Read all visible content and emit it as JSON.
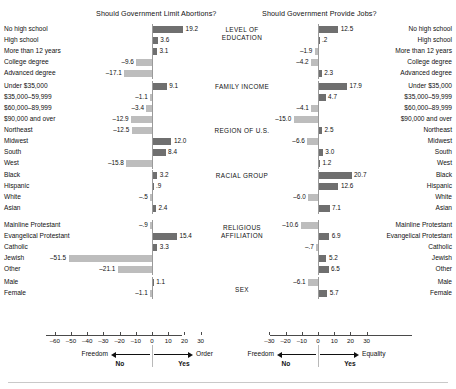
{
  "chart_data": {
    "type": "bar",
    "panels": [
      {
        "id": "abortions",
        "title": "Should Government Limit Abortions?",
        "xlabel": "",
        "ylabel": "",
        "xlim": [
          -65,
          33
        ],
        "ticks": [
          -60,
          -50,
          -40,
          -30,
          -20,
          -10,
          0,
          10,
          20,
          30
        ],
        "tick_labels": [
          "–60",
          "–50",
          "–40",
          "–30",
          "–20",
          "–10",
          "0",
          "10",
          "20",
          "30"
        ],
        "grid": false,
        "legend": {
          "left_word": "Freedom",
          "right_word": "Order",
          "left_answer": "No",
          "right_answer": "Yes"
        },
        "groups": [
          {
            "name": "LEVEL OF EDUCATION",
            "categories": [
              "No high school",
              "High school",
              "More than 12 years",
              "College degree",
              "Advanced degree"
            ],
            "values": [
              19.2,
              3.6,
              3.1,
              -9.6,
              -17.1
            ],
            "labels": [
              "19.2",
              "3.6",
              "3.1",
              "–9.6",
              "–17.1"
            ]
          },
          {
            "name": "FAMILY INCOME",
            "categories": [
              "Under $35,000",
              "$35,000–59,999",
              "$60,000–89,999",
              "$90,000 and over"
            ],
            "values": [
              9.1,
              -1.1,
              -3.4,
              -12.9
            ],
            "labels": [
              "9.1",
              "–1.1",
              "–3.4",
              "–12.9"
            ]
          },
          {
            "name": "REGION OF U.S.",
            "categories": [
              "Northeast",
              "Midwest",
              "South",
              "West"
            ],
            "values": [
              -12.5,
              12.0,
              8.4,
              -15.8
            ],
            "labels": [
              "–12.5",
              "12.0",
              "8.4",
              "–15.8"
            ]
          },
          {
            "name": "RACIAL GROUP",
            "categories": [
              "Black",
              "Hispanic",
              "White",
              "Asian"
            ],
            "values": [
              3.2,
              0.9,
              -0.5,
              2.4
            ],
            "labels": [
              "3.2",
              ".9",
              "–.5",
              "2.4"
            ]
          },
          {
            "name": "RELIGIOUS AFFILIATION",
            "categories": [
              "Mainline Protestant",
              "Evangelical Protestant",
              "Catholic",
              "Jewish",
              "Other"
            ],
            "values": [
              -0.9,
              15.4,
              3.3,
              -51.5,
              -21.1
            ],
            "labels": [
              "–.9",
              "15.4",
              "3.3",
              "–51.5",
              "–21.1"
            ]
          },
          {
            "name": "SEX",
            "categories": [
              "Male",
              "Female"
            ],
            "values": [
              1.1,
              -1.1
            ],
            "labels": [
              "1.1",
              "–1.1"
            ]
          }
        ]
      },
      {
        "id": "jobs",
        "title": "Should Government Provide Jobs?",
        "xlabel": "",
        "ylabel": "",
        "xlim": [
          -33,
          33
        ],
        "ticks": [
          -30,
          -20,
          -10,
          0,
          10,
          20,
          30
        ],
        "tick_labels": [
          "–30",
          "–20",
          "–10",
          "0",
          "10",
          "20",
          "30"
        ],
        "grid": false,
        "legend": {
          "left_word": "Freedom",
          "right_word": "Equality",
          "left_answer": "No",
          "right_answer": "Yes"
        },
        "groups": [
          {
            "name": "LEVEL OF EDUCATION",
            "categories": [
              "No high school",
              "High school",
              "More than 12 years",
              "College degree",
              "Advanced degree"
            ],
            "values": [
              12.5,
              0.2,
              -1.9,
              -4.2,
              2.3
            ],
            "labels": [
              "12.5",
              ".2",
              "–1.9",
              "–4.2",
              "2.3"
            ]
          },
          {
            "name": "FAMILY INCOME",
            "categories": [
              "Under $35,000",
              "$35,000–59,999",
              "$60,000–89,999",
              "$90,000 and over"
            ],
            "values": [
              17.9,
              4.7,
              -4.1,
              -15.0
            ],
            "labels": [
              "17.9",
              "4.7",
              "–4.1",
              "–15.0"
            ]
          },
          {
            "name": "REGION OF U.S.",
            "categories": [
              "Northeast",
              "Midwest",
              "South",
              "West"
            ],
            "values": [
              2.5,
              -6.6,
              3.0,
              1.2
            ],
            "labels": [
              "2.5",
              "–6.6",
              "3.0",
              "1.2"
            ]
          },
          {
            "name": "RACIAL GROUP",
            "categories": [
              "Black",
              "Hispanic",
              "White",
              "Asian"
            ],
            "values": [
              20.7,
              12.6,
              -6.0,
              7.1
            ],
            "labels": [
              "20.7",
              "12.6",
              "–6.0",
              "7.1"
            ]
          },
          {
            "name": "RELIGIOUS AFFILIATION",
            "categories": [
              "Mainline Protestant",
              "Evangelical Protestant",
              "Catholic",
              "Jewish",
              "Other"
            ],
            "values": [
              -10.6,
              6.9,
              -0.7,
              5.2,
              6.5
            ],
            "labels": [
              "–10.6",
              "6.9",
              "–.7",
              "5.2",
              "6.5"
            ]
          },
          {
            "name": "SEX",
            "categories": [
              "Male",
              "Female"
            ],
            "values": [
              -6.1,
              5.7
            ],
            "labels": [
              "–6.1",
              "5.7"
            ]
          }
        ]
      }
    ],
    "category_column": [
      "LEVEL OF\nEDUCATION",
      "FAMILY INCOME",
      "REGION OF U.S.",
      "RACIAL GROUP",
      "RELIGIOUS\nAFFILIATION",
      "SEX"
    ],
    "colors": {
      "positive_bar": "#6f6f6f",
      "negative_bar": "#bdbdbd",
      "axis": "#4a4a4a",
      "zero_line": "#9a9a9a",
      "text": "#111111",
      "background": "#ffffff"
    }
  }
}
